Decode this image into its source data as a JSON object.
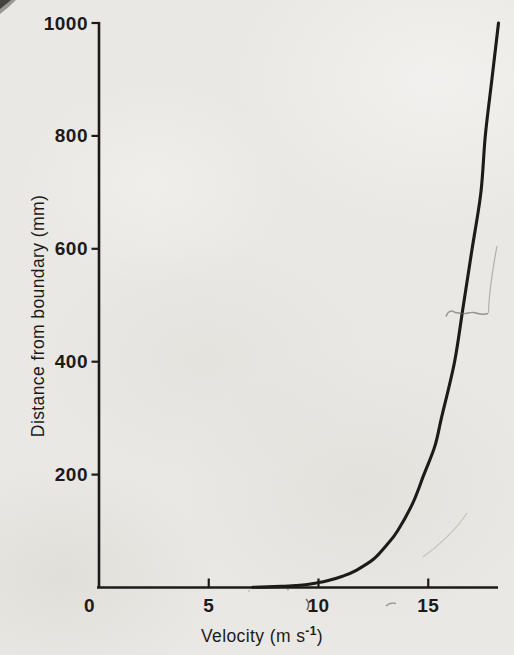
{
  "page": {
    "background": "#eae8e4",
    "ink": "#1c1b19"
  },
  "chart_data": {
    "type": "line",
    "title": "",
    "xlabel": "Velocity (m s⁻¹)",
    "xlabel_parts": {
      "main": "Velocity (m s",
      "sup": "-1",
      "end": ")"
    },
    "ylabel": "Distance from boundary (mm)",
    "xlim": [
      0,
      18.3
    ],
    "ylim": [
      0,
      1000
    ],
    "grid": false,
    "legend": false,
    "x_ticks": [
      {
        "value": 0,
        "label": "0"
      },
      {
        "value": 5,
        "label": "5"
      },
      {
        "value": 10,
        "label": "10"
      },
      {
        "value": 15,
        "label": "15"
      }
    ],
    "y_ticks": [
      {
        "value": 200,
        "label": "200"
      },
      {
        "value": 400,
        "label": "400"
      },
      {
        "value": 600,
        "label": "600"
      },
      {
        "value": 800,
        "label": "800"
      },
      {
        "value": 1000,
        "label": "1000"
      }
    ],
    "series": [
      {
        "name": "velocity-profile",
        "color": "#1c1b19",
        "points_velocity_vs_distance": [
          [
            7.0,
            0.5
          ],
          [
            7.7,
            1
          ],
          [
            8.3,
            2
          ],
          [
            8.8,
            3
          ],
          [
            9.4,
            5
          ],
          [
            9.9,
            8
          ],
          [
            10.4,
            12
          ],
          [
            11.1,
            20
          ],
          [
            11.7,
            30
          ],
          [
            12.5,
            50
          ],
          [
            13.1,
            75
          ],
          [
            13.6,
            100
          ],
          [
            14.3,
            150
          ],
          [
            14.8,
            200
          ],
          [
            15.3,
            250
          ],
          [
            15.6,
            300
          ],
          [
            16.2,
            400
          ],
          [
            16.6,
            500
          ],
          [
            17.0,
            600
          ],
          [
            17.4,
            700
          ],
          [
            17.6,
            800
          ],
          [
            17.9,
            900
          ],
          [
            18.2,
            1000
          ]
        ]
      }
    ]
  }
}
